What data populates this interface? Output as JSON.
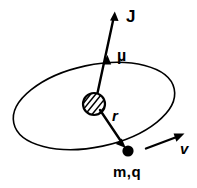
{
  "figure": {
    "background_color": "#ffffff",
    "ink_color": "#000000",
    "width": 197,
    "height": 188
  },
  "labels": {
    "angular_momentum": "J",
    "magnetic_moment": "µ",
    "radius": "r",
    "velocity": "v",
    "particle": "m,q"
  },
  "elements": {
    "orbit_name": "orbit-ellipse",
    "nucleus_name": "hatched-nucleus",
    "particle_name": "orbiting-particle-dot"
  },
  "geometry": {
    "orbit": {
      "center_x": 94,
      "center_y": 106,
      "radius_x": 82,
      "radius_y": 41,
      "rotation_deg": -12
    },
    "nucleus": {
      "center_x": 94,
      "center_y": 104,
      "radius": 11
    },
    "particle": {
      "center_x": 128,
      "center_y": 151,
      "radius": 5.5
    },
    "angular_momentum_vector": {
      "tail_x": 96,
      "tail_y": 100,
      "tip_x": 113,
      "tip_y": 13
    },
    "magnetic_moment_vector": {
      "tail_x": 96,
      "tail_y": 100,
      "tip_x": 107,
      "tip_y": 56
    },
    "radius_vector": {
      "tail_x": 100,
      "tail_y": 110,
      "tip_x": 125,
      "tip_y": 147
    },
    "velocity_vector": {
      "tail_x": 146,
      "tail_y": 148,
      "tip_x": 184,
      "tip_y": 134
    }
  }
}
